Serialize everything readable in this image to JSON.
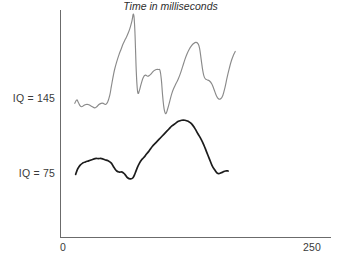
{
  "chart_data": {
    "type": "line",
    "title": "",
    "subtitle": "",
    "xlabel": "Time in milliseconds",
    "ylabel": "",
    "xlim": [
      0,
      250
    ],
    "ylim": [
      0,
      200
    ],
    "grid": false,
    "legend": "none",
    "x_tick_labels": [
      "0",
      "250"
    ],
    "y_tick_labels": [
      "IQ = 145",
      "IQ = 75"
    ],
    "y_tick_values": [
      145,
      75
    ],
    "annotations": [],
    "series": [
      {
        "name": "IQ = 145",
        "color": "#8a8a8a",
        "stroke_width": 1.15,
        "points": [
          [
            13.2,
            119
          ],
          [
            15.0,
            122
          ],
          [
            16.4,
            120
          ],
          [
            18.0,
            117
          ],
          [
            19.6,
            116
          ],
          [
            21.5,
            117
          ],
          [
            23.5,
            118
          ],
          [
            25.5,
            118
          ],
          [
            27.5,
            117
          ],
          [
            29.5,
            116
          ],
          [
            31.5,
            115
          ],
          [
            33.5,
            116
          ],
          [
            35.5,
            118
          ],
          [
            37.5,
            119
          ],
          [
            39.5,
            119
          ],
          [
            41.5,
            118
          ],
          [
            43.5,
            120
          ],
          [
            45.5,
            126
          ],
          [
            47.0,
            134
          ],
          [
            48.5,
            142
          ],
          [
            50.0,
            149
          ],
          [
            52.0,
            156
          ],
          [
            54.0,
            162
          ],
          [
            56.0,
            167
          ],
          [
            58.0,
            172
          ],
          [
            60.0,
            176
          ],
          [
            62.0,
            180
          ],
          [
            64.0,
            185
          ],
          [
            66.0,
            192
          ],
          [
            67.5,
            198
          ],
          [
            68.5,
            188
          ],
          [
            69.3,
            168
          ],
          [
            70.0,
            148
          ],
          [
            70.8,
            134
          ],
          [
            71.6,
            128
          ],
          [
            72.8,
            130
          ],
          [
            74.5,
            136
          ],
          [
            76.5,
            142
          ],
          [
            78.5,
            144
          ],
          [
            80.5,
            143
          ],
          [
            82.5,
            144
          ],
          [
            84.5,
            146
          ],
          [
            86.5,
            148
          ],
          [
            88.5,
            149
          ],
          [
            90.5,
            149
          ],
          [
            92.0,
            148
          ],
          [
            93.2,
            140
          ],
          [
            94.2,
            128
          ],
          [
            95.2,
            118
          ],
          [
            96.2,
            112
          ],
          [
            97.5,
            110
          ],
          [
            99.0,
            114
          ],
          [
            101.0,
            121
          ],
          [
            103.0,
            128
          ],
          [
            105.0,
            133
          ],
          [
            107.0,
            137
          ],
          [
            109.0,
            141
          ],
          [
            111.0,
            146
          ],
          [
            113.0,
            152
          ],
          [
            115.0,
            158
          ],
          [
            117.0,
            163
          ],
          [
            119.0,
            167
          ],
          [
            121.0,
            170
          ],
          [
            123.0,
            172
          ],
          [
            125.0,
            173
          ],
          [
            127.0,
            172
          ],
          [
            128.5,
            168
          ],
          [
            130.0,
            158
          ],
          [
            131.5,
            148
          ],
          [
            133.0,
            142
          ],
          [
            135.0,
            140
          ],
          [
            137.5,
            139
          ],
          [
            140.0,
            136
          ],
          [
            142.0,
            131
          ],
          [
            144.0,
            126
          ],
          [
            146.0,
            123
          ],
          [
            148.0,
            123
          ],
          [
            150.0,
            126
          ],
          [
            152.0,
            133
          ],
          [
            154.0,
            142
          ],
          [
            156.0,
            150
          ],
          [
            158.0,
            157
          ],
          [
            160.0,
            162
          ],
          [
            161.5,
            165
          ]
        ]
      },
      {
        "name": "IQ = 75",
        "color": "#1c1c1c",
        "stroke_width": 1.7,
        "points": [
          [
            14.0,
            56
          ],
          [
            16.0,
            61
          ],
          [
            18.0,
            64
          ],
          [
            20.5,
            66
          ],
          [
            23.0,
            67
          ],
          [
            26.0,
            68
          ],
          [
            29.0,
            69
          ],
          [
            32.0,
            70
          ],
          [
            35.0,
            70
          ],
          [
            38.0,
            70
          ],
          [
            41.0,
            69
          ],
          [
            44.0,
            68
          ],
          [
            47.0,
            66
          ],
          [
            49.5,
            62
          ],
          [
            52.0,
            59
          ],
          [
            54.5,
            58
          ],
          [
            57.0,
            58
          ],
          [
            59.5,
            56
          ],
          [
            62.0,
            53
          ],
          [
            64.5,
            52
          ],
          [
            67.0,
            53
          ],
          [
            69.0,
            57
          ],
          [
            71.0,
            62
          ],
          [
            73.0,
            66
          ],
          [
            75.0,
            69
          ],
          [
            77.0,
            71
          ],
          [
            79.5,
            74
          ],
          [
            82.0,
            77
          ],
          [
            85.0,
            81
          ],
          [
            88.0,
            84
          ],
          [
            91.0,
            87
          ],
          [
            94.0,
            90
          ],
          [
            97.0,
            93
          ],
          [
            100.0,
            96
          ],
          [
            103.0,
            99
          ],
          [
            106.0,
            101
          ],
          [
            109.0,
            103
          ],
          [
            112.0,
            104
          ],
          [
            115.0,
            104
          ],
          [
            118.0,
            103
          ],
          [
            121.0,
            101
          ],
          [
            124.0,
            97
          ],
          [
            127.0,
            92
          ],
          [
            130.0,
            87
          ],
          [
            132.5,
            82
          ],
          [
            135.0,
            76
          ],
          [
            137.5,
            70
          ],
          [
            140.0,
            64
          ],
          [
            142.5,
            60
          ],
          [
            145.0,
            57
          ],
          [
            147.5,
            57
          ],
          [
            150.0,
            58
          ],
          [
            152.5,
            59
          ],
          [
            155.0,
            59
          ]
        ]
      }
    ]
  },
  "axes": {
    "x_min_label": "0",
    "x_max_label": "250",
    "x_title": "Time in milliseconds",
    "y_label_upper": "IQ = 145",
    "y_label_lower": "IQ = 75",
    "axis_color": "#6b6b6b"
  }
}
